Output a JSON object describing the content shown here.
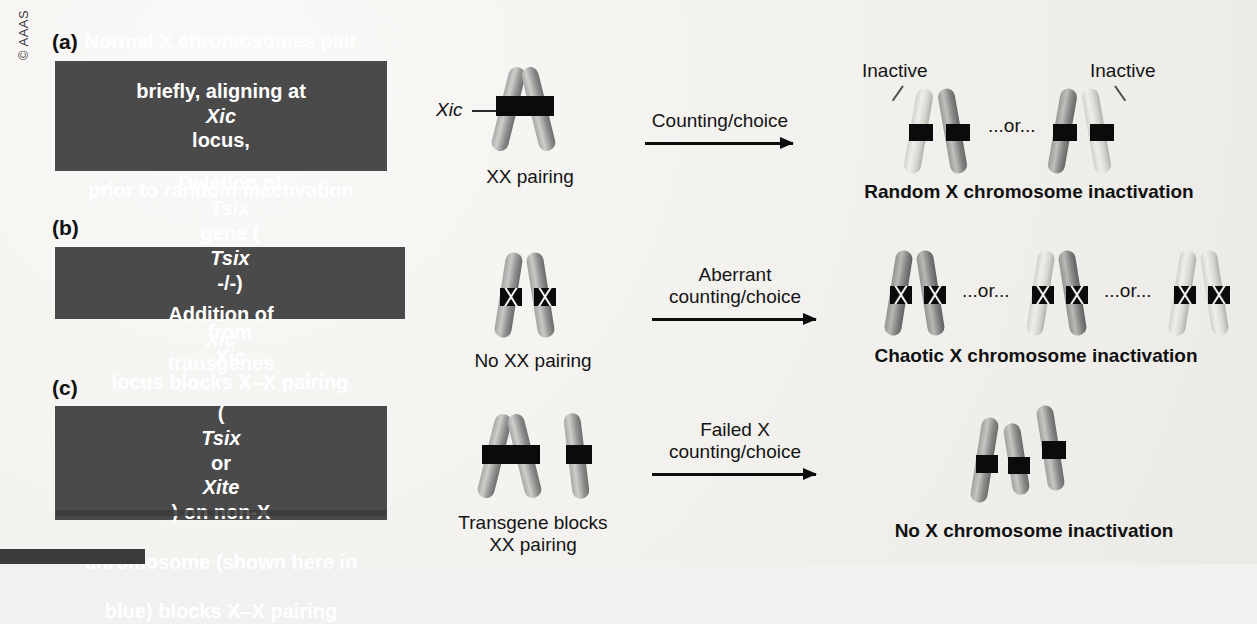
{
  "figure": {
    "copyright": "© AAAS",
    "colors": {
      "background": "#f2f1ef",
      "textbox_fill": "#4a4a4a",
      "textbox_text": "#ffffff",
      "band_black": "#0b0b0b",
      "chromosome_active": "#8f8f8f",
      "chromosome_inactive": "#d8d6d1",
      "arrow": "#0d0d0d"
    }
  },
  "panels": [
    {
      "label": "(a)",
      "textbox": {
        "line1": "Normal X chromosomes pair",
        "line2_a": "briefly, aligning at ",
        "line2_italic": "Xic",
        "line2_b": " locus,",
        "line3": "prior to random inactivation"
      },
      "middle": {
        "locus_label": "Xic",
        "caption": "XX pairing"
      },
      "arrow_label_line1": "Counting/choice",
      "arrow_label_line2": "",
      "right": {
        "inactive_label_left": "Inactive",
        "inactive_label_right": "Inactive",
        "or_text": "...or...",
        "outcome": "Random X chromosome inactivation"
      }
    },
    {
      "label": "(b)",
      "textbox": {
        "line1_a": "Deletion of ",
        "line1_italic": "Tsix",
        "line1_b": " gene (",
        "line1_italic2": "Tsix",
        "line1_c": " -/-)",
        "line2_a": "from ",
        "line2_italic": "Xic",
        "line2_b": " locus blocks X–X pairing"
      },
      "middle": {
        "caption": "No XX pairing"
      },
      "arrow_label_line1": "Aberrant",
      "arrow_label_line2": "counting/choice",
      "right": {
        "or_text_1": "...or...",
        "or_text_2": "...or...",
        "outcome": "Chaotic X chromosome inactivation"
      }
    },
    {
      "label": "(c)",
      "textbox": {
        "line1_a": "Addition of ",
        "line1_italic": "Xic",
        "line1_b": " transgenes",
        "line2_a": "(",
        "line2_italic": "Tsix",
        "line2_b": " or ",
        "line2_italic2": "Xite",
        "line2_c": ") on non-X",
        "line3": "chromosome (shown here in",
        "line4": "blue) blocks X–X pairing"
      },
      "middle": {
        "caption_line1": "Transgene blocks",
        "caption_line2": "XX pairing"
      },
      "arrow_label_line1": "Failed X",
      "arrow_label_line2": "counting/choice",
      "right": {
        "outcome": "No X chromosome inactivation"
      }
    }
  ]
}
